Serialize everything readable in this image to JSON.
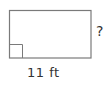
{
  "diagram": {
    "shape": "rectangle",
    "stroke_color": "#7a7a7a",
    "right_angle_marker": true,
    "labels": {
      "bottom_side": "11 ft",
      "right_side": "?"
    }
  }
}
